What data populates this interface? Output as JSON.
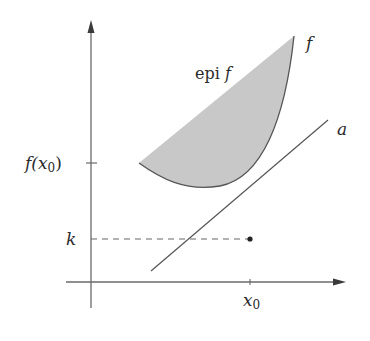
{
  "diagram": {
    "type": "convex-function-epigraph",
    "labels": {
      "epigraph": "epi f",
      "epi_text": "epi ",
      "epi_f": "f",
      "curve": "f",
      "line": "a",
      "y_tick": "f(x",
      "y_tick_sub": "0",
      "y_tick_close": ")",
      "k": "k",
      "x_tick": "x",
      "x_tick_sub": "0"
    },
    "colors": {
      "axis": "#6a6a6a",
      "curve": "#555555",
      "fill": "#c8c8c8",
      "line": "#555555",
      "dash": "#666666",
      "point": "#222222",
      "text": "#2a2a2a"
    }
  }
}
